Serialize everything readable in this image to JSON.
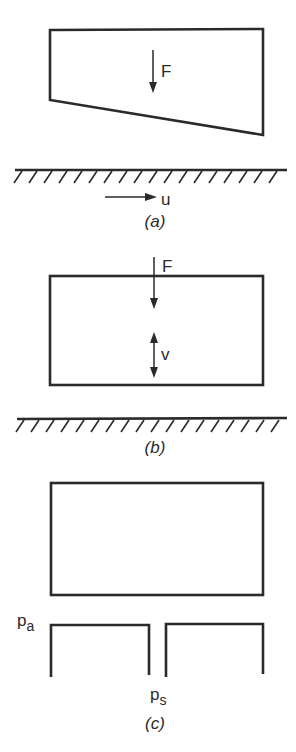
{
  "figure": {
    "panels": [
      {
        "id": "a",
        "caption": "(a)",
        "description": "Tilted slider bearing block above moving surface",
        "force_label": "F",
        "velocity_label": "u",
        "velocity_direction": "right"
      },
      {
        "id": "b",
        "caption": "(b)",
        "description": "Squeeze-film block above stationary surface",
        "force_label": "F",
        "velocity_label": "v",
        "velocity_direction": "up-down"
      },
      {
        "id": "c",
        "caption": "(c)",
        "description": "Externally pressurized (hydrostatic) bearing with supply port",
        "ambient_pressure_label": "p",
        "ambient_pressure_sub": "a",
        "supply_pressure_label": "p",
        "supply_pressure_sub": "s"
      }
    ]
  },
  "colors": {
    "ink": "#2a2a2a",
    "background": "#ffffff"
  }
}
